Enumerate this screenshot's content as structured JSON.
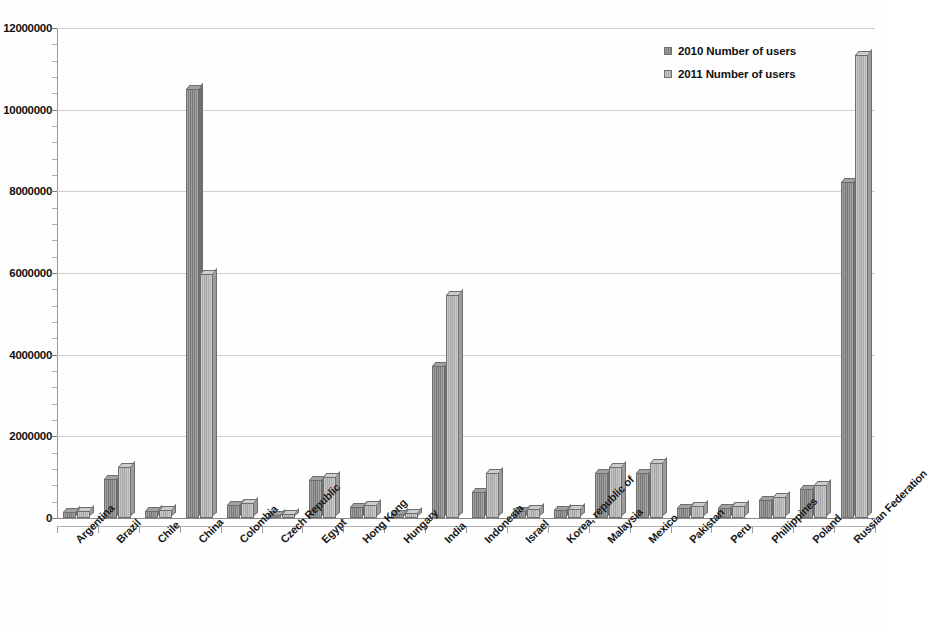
{
  "chart_data": {
    "type": "bar",
    "title": "",
    "subtitle": "",
    "xlabel": "",
    "ylabel": "",
    "ylim": [
      0,
      12000000
    ],
    "ytick_step": 2000000,
    "ytick_labels": [
      "12000000",
      "10000000",
      "8000000",
      "6000000",
      "4000000",
      "2000000",
      "0"
    ],
    "ytick_values": [
      12000000,
      10000000,
      8000000,
      6000000,
      4000000,
      2000000,
      0
    ],
    "grid": true,
    "grid_axis": "y",
    "minor_ticks_per_interval": 5,
    "legend_position": "top-right",
    "categories": [
      "Argentina",
      "Brazil",
      "Chile",
      "China",
      "Colombia",
      "Czech Republic",
      "Egypt",
      "Hong Kong",
      "Hungary",
      "India",
      "Indonesia",
      "Israel",
      "Korea, republic of",
      "Malaysia",
      "Mexico",
      "Pakistan",
      "Peru",
      "Phillippines",
      "Poland",
      "Russian Federation"
    ],
    "series": [
      {
        "name": "2010 Number of users",
        "color": "#838383",
        "values": [
          150000,
          950000,
          180000,
          10500000,
          330000,
          70000,
          920000,
          280000,
          95000,
          3720000,
          640000,
          180000,
          190000,
          1100000,
          1110000,
          250000,
          250000,
          440000,
          720000,
          8230000
        ]
      },
      {
        "name": "2011 Number of users",
        "color": "#b2b2b2",
        "values": [
          165000,
          1240000,
          200000,
          5970000,
          370000,
          90000,
          1000000,
          330000,
          115000,
          5450000,
          1110000,
          210000,
          220000,
          1250000,
          1350000,
          300000,
          290000,
          510000,
          800000,
          11340000
        ]
      }
    ]
  },
  "legend": {
    "items": [
      {
        "label": "2010 Number of users",
        "swatch_class": "s2010"
      },
      {
        "label": "2011 Number of users",
        "swatch_class": "s2011"
      }
    ]
  }
}
